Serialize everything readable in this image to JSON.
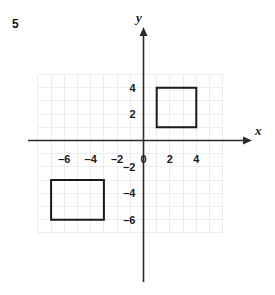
{
  "figure": {
    "problem_number": "5",
    "axis_labels": {
      "x": "x",
      "y": "y"
    },
    "x_tick_labels": [
      "-6",
      "-4",
      "-2",
      "0",
      "2",
      "4"
    ],
    "x_tick_values": [
      -6,
      -4,
      -2,
      0,
      2,
      4
    ],
    "y_tick_labels": [
      "4",
      "2",
      "-2",
      "-4",
      "-6"
    ],
    "y_tick_values": [
      4,
      2,
      -2,
      -4,
      -6
    ],
    "origin_label": "0",
    "grid": {
      "x_min": -8,
      "x_max": 6,
      "y_min": -7,
      "y_max": 5,
      "step": 1,
      "visible": true,
      "color": "#ededf0"
    },
    "axis_color": "#2b2b2b",
    "shape_color": "#1a1a1a",
    "shapes": [
      {
        "name": "square-upper-right",
        "type": "square",
        "x_min": 1,
        "x_max": 4,
        "y_min": 1,
        "y_max": 4,
        "vertices": [
          [
            1,
            1
          ],
          [
            4,
            1
          ],
          [
            4,
            4
          ],
          [
            1,
            4
          ]
        ]
      },
      {
        "name": "square-lower-left",
        "type": "square",
        "x_min": -7,
        "x_max": -3,
        "y_min": -6,
        "y_max": -3,
        "vertices": [
          [
            -7,
            -6
          ],
          [
            -3,
            -6
          ],
          [
            -3,
            -3
          ],
          [
            -7,
            -3
          ]
        ]
      }
    ]
  }
}
